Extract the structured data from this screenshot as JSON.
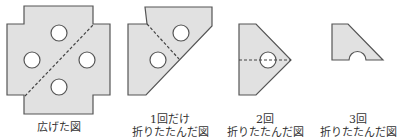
{
  "colors": {
    "paper_fill": "#e1e1e1",
    "outline": "#555555",
    "hole": "#ffffff",
    "fold_line": "#444444"
  },
  "figures": [
    {
      "id": "unfolded",
      "label_line1": "広げた図",
      "label_line2": "",
      "holes": 4,
      "fold_line": "diagonal dashed"
    },
    {
      "id": "folded-once",
      "label_line1": "1回だけ",
      "label_line2": "折りたたんだ図",
      "holes": 2,
      "fold_line": "diagonal dashed"
    },
    {
      "id": "folded-twice",
      "label_line1": "2回",
      "label_line2": "折りたたんだ図",
      "holes": 1,
      "fold_line": "horizontal dashed"
    },
    {
      "id": "folded-thrice",
      "label_line1": "3回",
      "label_line2": "折りたたんだ図",
      "holes": 0.5,
      "fold_line": "none"
    }
  ]
}
